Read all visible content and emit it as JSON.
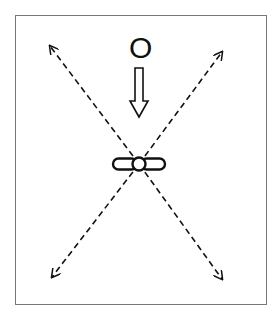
{
  "diagram": {
    "label": "O",
    "center": [
      139,
      164
    ],
    "arrow_tips": {
      "top_left": [
        49,
        45
      ],
      "top_right": [
        223,
        51
      ],
      "bottom_left": [
        51,
        278
      ],
      "bottom_right": [
        223,
        280
      ]
    },
    "colors": {
      "stroke": "#111111",
      "frame": "#777777",
      "background": "#ffffff"
    }
  }
}
